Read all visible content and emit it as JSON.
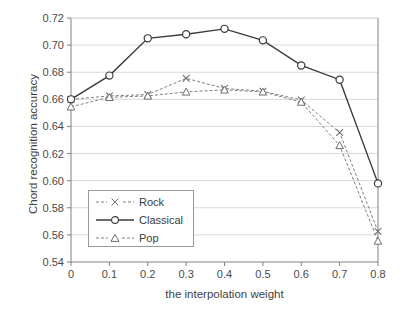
{
  "chart_data": {
    "type": "line",
    "title": "",
    "xlabel": "the interpolation weight",
    "ylabel": "Chord recognition accuracy",
    "x": [
      0,
      0.1,
      0.2,
      0.3,
      0.4,
      0.5,
      0.6,
      0.7,
      0.8
    ],
    "xtick_labels": [
      "0",
      "0.1",
      "0.2",
      "0.3",
      "0.4",
      "0.5",
      "0.6",
      "0.7",
      "0.8"
    ],
    "ytick_labels": [
      "0.72",
      "0.70",
      "0.68",
      "0.66",
      "0.64",
      "0.62",
      "0.60",
      "0.58",
      "0.56",
      "0.54"
    ],
    "ytick_values": [
      0.72,
      0.7,
      0.68,
      0.66,
      0.64,
      0.62,
      0.6,
      0.58,
      0.56,
      0.54
    ],
    "xlim": [
      0,
      0.8
    ],
    "ylim": [
      0.54,
      0.72
    ],
    "grid": true,
    "legend_position": "center-left-inside",
    "series": [
      {
        "name": "Rock",
        "marker": "x",
        "linestyle": "dashed",
        "color": "#808080",
        "values": [
          0.66,
          0.6625,
          0.6635,
          0.6755,
          0.668,
          0.666,
          0.6595,
          0.6355,
          0.5625
        ]
      },
      {
        "name": "Classical",
        "marker": "circle",
        "linestyle": "solid",
        "color": "#3b3b3b",
        "values": [
          0.66,
          0.6775,
          0.705,
          0.708,
          0.712,
          0.7035,
          0.685,
          0.6745,
          0.598
        ]
      },
      {
        "name": "Pop",
        "marker": "triangle",
        "linestyle": "dashed",
        "color": "#808080",
        "values": [
          0.6545,
          0.6615,
          0.6625,
          0.6655,
          0.667,
          0.6655,
          0.658,
          0.626,
          0.5555
        ]
      }
    ]
  },
  "axes": {
    "y_title": "Chord recognition accuracy",
    "x_title": "the interpolation weight"
  },
  "legend": {
    "items": [
      {
        "label": "Rock"
      },
      {
        "label": "Classical"
      },
      {
        "label": "Pop"
      }
    ]
  },
  "colors": {
    "axis": "#808080",
    "grid": "#d9d9d9",
    "classical": "#3b3b3b",
    "rock": "#808080",
    "pop": "#808080",
    "text": "#3b3b3b"
  }
}
